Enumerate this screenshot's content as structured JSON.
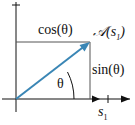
{
  "diagram": {
    "labels": {
      "cos": "cos(θ)",
      "sin": "sin(θ)",
      "theta": "θ",
      "point": "𝒜(s",
      "point_sub": "1",
      "point_close": ")",
      "axis_x": "s",
      "axis_x_sub": "1"
    },
    "colors": {
      "vector": "#3a86b5",
      "axes": "#111111",
      "rect": "#555555"
    }
  }
}
